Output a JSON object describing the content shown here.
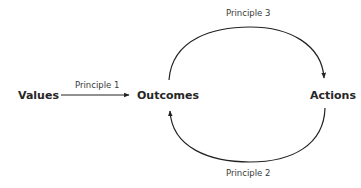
{
  "diagram": {
    "nodes": {
      "values": "Values",
      "outcomes": "Outcomes",
      "actions": "Actions"
    },
    "edges": [
      {
        "from": "Values",
        "to": "Outcomes",
        "label": "Principle 1",
        "shape": "straight"
      },
      {
        "from": "Outcomes",
        "to": "Actions",
        "label": "Principle 3",
        "shape": "arc-top"
      },
      {
        "from": "Actions",
        "to": "Outcomes",
        "label": "Principle 2",
        "shape": "arc-bottom"
      }
    ],
    "labels": {
      "p1": "Principle 1",
      "p2": "Principle 2",
      "p3": "Principle 3"
    },
    "colors": {
      "stroke": "#222222",
      "text": "#262626",
      "background": "#ffffff"
    }
  }
}
